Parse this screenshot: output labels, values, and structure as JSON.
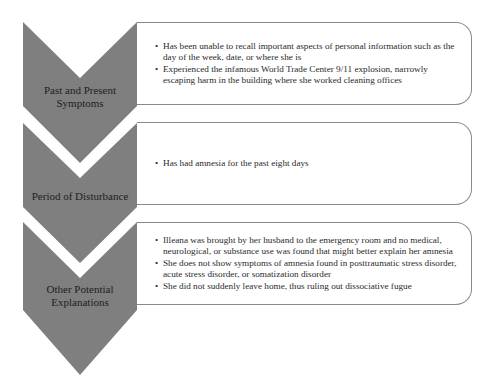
{
  "colors": {
    "chevron_fill": "#7f7f7f",
    "box_border": "#8a8a8a",
    "text": "#1e1e1e"
  },
  "stages": [
    {
      "label": "Past and Present Symptoms",
      "label_lines": [
        "Past and Present",
        "Symptoms"
      ],
      "bullets": [
        "Has been unable to recall important aspects of personal information such as the day of the week, date, or where she is",
        "Experienced the infamous World Trade Center 9/11 explosion, narrowly escaping harm in the building where she worked cleaning offices"
      ]
    },
    {
      "label": "Period of Disturbance",
      "label_lines": [
        "Period of Disturbance"
      ],
      "bullets": [
        "Has had amnesia for the past eight days"
      ]
    },
    {
      "label": "Other Potential Explanations",
      "label_lines": [
        "Other Potential",
        "Explanations"
      ],
      "bullets": [
        "Illeana was brought by her husband to the emergency room and no medical, neurological, or substance use was found that might better explain her amnesia",
        "She does not show symptoms of amnesia found in posttraumatic stress disorder, acute stress disorder, or somatization disorder",
        "She did not suddenly leave home, thus ruling out dissociative fugue"
      ]
    }
  ]
}
